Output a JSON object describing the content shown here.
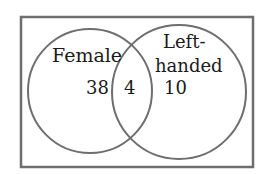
{
  "diagram": {
    "type": "venn",
    "universe": {
      "label": ""
    },
    "sets": [
      {
        "id": "female",
        "label": "Female",
        "only_count": "38"
      },
      {
        "id": "left_handed",
        "label_line1": "Left-",
        "label_line2": "handed",
        "only_count": "10"
      }
    ],
    "intersection": {
      "sets": [
        "female",
        "left_handed"
      ],
      "count": "4"
    },
    "colors": {
      "stroke": "#6e6e6e",
      "text": "#1a1a1a",
      "background": "#ffffff"
    }
  }
}
